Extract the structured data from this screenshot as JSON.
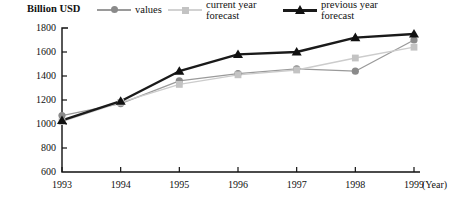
{
  "chart_data": {
    "type": "line",
    "title": "",
    "subtitle": "",
    "ylabel": "Billion USD",
    "xlabel": "(Year)",
    "categories": [
      "1993",
      "1994",
      "1995",
      "1996",
      "1997",
      "1998",
      "1999"
    ],
    "x": [
      1993,
      1994,
      1995,
      1996,
      1997,
      1998,
      1999
    ],
    "ylim": [
      600,
      1800
    ],
    "yticks": [
      600,
      800,
      1000,
      1200,
      1400,
      1600,
      1800
    ],
    "ytick_labels": [
      "600",
      "800",
      "1000",
      "1200",
      "1400",
      "1600",
      "1800"
    ],
    "grid": false,
    "legend_position": "top",
    "series": [
      {
        "name": "values",
        "marker": "circle",
        "color": "#8a8a8a",
        "line_color": "#9a9a9a",
        "values": [
          1070,
          1170,
          1360,
          1420,
          1460,
          1440,
          1700
        ]
      },
      {
        "name": "current year\nforecast",
        "marker": "square",
        "color": "#c3c3c3",
        "line_color": "#cccccc",
        "values": [
          1020,
          1180,
          1330,
          1410,
          1450,
          1550,
          1640
        ]
      },
      {
        "name": "previous year\nforecast",
        "marker": "triangle",
        "color": "#111111",
        "line_color": "#1a1a1a",
        "values": [
          1030,
          1190,
          1440,
          1580,
          1600,
          1720,
          1750
        ]
      }
    ]
  },
  "legend": {
    "items": [
      {
        "label": "values",
        "marker": "circle-marker",
        "color": "#8a8a8a"
      },
      {
        "label": "current year\nforecast",
        "marker": "square-marker",
        "color": "#c3c3c3"
      },
      {
        "label": "previous year\nforecast",
        "marker": "triangle-marker",
        "color": "#111111"
      }
    ]
  },
  "axes": {
    "y_axis_title": "Billion USD",
    "x_axis_unit": "(Year)"
  }
}
